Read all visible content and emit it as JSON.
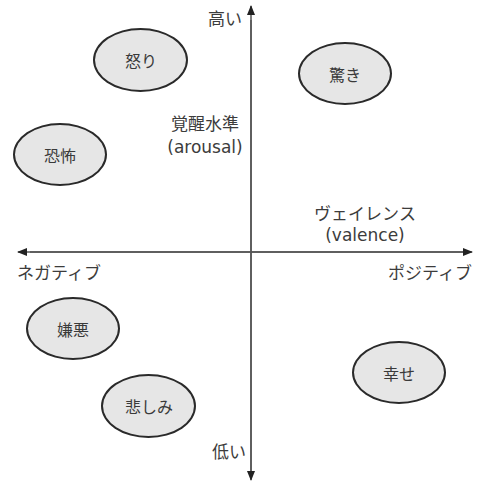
{
  "diagram": {
    "type": "circumplex-model-of-affect",
    "axes": {
      "vertical": {
        "name": "覚醒水準",
        "name_en": "(arousal)",
        "top_label": "高い",
        "bottom_label": "低い"
      },
      "horizontal": {
        "name": "ヴェイレンス",
        "name_en": "(valence)",
        "left_label": "ネガティブ",
        "right_label": "ポジティブ"
      }
    },
    "emotions": [
      {
        "label": "怒り",
        "quadrant": "negative-high",
        "cx": 140,
        "cy": 60
      },
      {
        "label": "驚き",
        "quadrant": "positive-high",
        "cx": 345,
        "cy": 73
      },
      {
        "label": "恐怖",
        "quadrant": "negative-high",
        "cx": 60,
        "cy": 155
      },
      {
        "label": "嫌悪",
        "quadrant": "negative-low",
        "cx": 73,
        "cy": 328
      },
      {
        "label": "悲しみ",
        "quadrant": "negative-low",
        "cx": 148,
        "cy": 406
      },
      {
        "label": "幸せ",
        "quadrant": "positive-low",
        "cx": 399,
        "cy": 372
      }
    ],
    "colors": {
      "axis": "#4a4a4a",
      "ellipse_fill": "#e6e6e6",
      "ellipse_stroke": "#2a2a2a",
      "text": "#3c3c3c"
    }
  }
}
